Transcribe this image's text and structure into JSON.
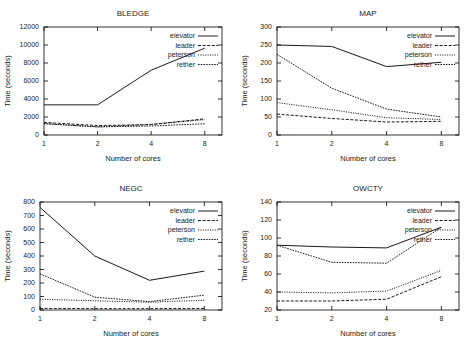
{
  "figure": {
    "width": 473,
    "height": 350,
    "background": "#ffffff",
    "line_color": "#000000",
    "text_color": "#222222",
    "series_names": [
      "elevator",
      "leader",
      "peterson",
      "rether"
    ],
    "series_styles": [
      "solid",
      "dashed",
      "dotted",
      "thin-dashdot"
    ],
    "common_xlabel": "Number of cores",
    "common_ylabel": "Time (seconds)"
  },
  "chart_data": [
    {
      "type": "line",
      "title": "BLEDGE",
      "xlabel": "Number of cores",
      "ylabel": "Time (seconds)",
      "x": [
        1,
        2,
        4,
        8
      ],
      "xticklabels": [
        "1",
        "2",
        "4",
        "8"
      ],
      "xscale": "log2",
      "xlim": [
        1,
        10
      ],
      "ylim": [
        0,
        12000
      ],
      "yticks": [
        0,
        2000,
        4000,
        6000,
        8000,
        10000,
        12000
      ],
      "yticklabels": [
        "0",
        "2000",
        "4000",
        "6000",
        "8000",
        "10000",
        "12000"
      ],
      "grid": false,
      "legend_position": "upper right",
      "series": [
        {
          "name": "elevator",
          "style": "solid",
          "values": [
            3350,
            3350,
            7200,
            9650
          ]
        },
        {
          "name": "leader",
          "style": "dashed",
          "values": [
            1400,
            1050,
            1150,
            1800
          ]
        },
        {
          "name": "peterson",
          "style": "dotted",
          "values": [
            1280,
            900,
            1200,
            1700
          ]
        },
        {
          "name": "rether",
          "style": "thin-dashdot",
          "values": [
            1250,
            900,
            1000,
            1250
          ]
        }
      ]
    },
    {
      "type": "line",
      "title": "MAP",
      "xlabel": "Number of cores",
      "ylabel": "Time (seconds)",
      "x": [
        1,
        2,
        4,
        8
      ],
      "xticklabels": [
        "1",
        "2",
        "4",
        "8"
      ],
      "xscale": "log2",
      "xlim": [
        1,
        10
      ],
      "ylim": [
        0,
        300
      ],
      "yticks": [
        0,
        50,
        100,
        150,
        200,
        250,
        300
      ],
      "yticklabels": [
        "0",
        "50",
        "100",
        "150",
        "200",
        "250",
        "300"
      ],
      "grid": false,
      "legend_position": "upper right",
      "series": [
        {
          "name": "elevator",
          "style": "solid",
          "values": [
            250,
            246,
            190,
            202
          ]
        },
        {
          "name": "leader",
          "style": "dashed",
          "values": [
            58,
            46,
            36,
            38
          ]
        },
        {
          "name": "peterson",
          "style": "dotted",
          "values": [
            90,
            70,
            48,
            43
          ]
        },
        {
          "name": "rether",
          "style": "thin-dashdot",
          "values": [
            224,
            130,
            72,
            50
          ]
        }
      ]
    },
    {
      "type": "line",
      "title": "NEGC",
      "xlabel": "Number of cores",
      "ylabel": "Time (seconds)",
      "x": [
        1,
        2,
        4,
        8
      ],
      "xticklabels": [
        "1",
        "2",
        "4",
        "8"
      ],
      "xscale": "log2",
      "xlim": [
        1,
        10
      ],
      "ylim": [
        0,
        800
      ],
      "yticks": [
        0,
        100,
        200,
        300,
        400,
        500,
        600,
        700,
        800
      ],
      "yticklabels": [
        "0",
        "100",
        "200",
        "300",
        "400",
        "500",
        "600",
        "700",
        "800"
      ],
      "grid": false,
      "legend_position": "upper right",
      "series": [
        {
          "name": "elevator",
          "style": "solid",
          "values": [
            760,
            400,
            220,
            288
          ]
        },
        {
          "name": "leader",
          "style": "dashed",
          "values": [
            12,
            10,
            10,
            12
          ]
        },
        {
          "name": "peterson",
          "style": "dotted",
          "values": [
            80,
            68,
            58,
            72
          ]
        },
        {
          "name": "rether",
          "style": "thin-dashdot",
          "values": [
            268,
            95,
            62,
            110
          ]
        }
      ]
    },
    {
      "type": "line",
      "title": "OWCTY",
      "xlabel": "Number of cores",
      "ylabel": "Time (seconds)",
      "x": [
        1,
        2,
        4,
        8
      ],
      "xticklabels": [
        "1",
        "2",
        "4",
        "8"
      ],
      "xscale": "log2",
      "xlim": [
        1,
        10
      ],
      "ylim": [
        20,
        140
      ],
      "yticks": [
        20,
        40,
        60,
        80,
        100,
        120,
        140
      ],
      "yticklabels": [
        "20",
        "40",
        "60",
        "80",
        "100",
        "120",
        "140"
      ],
      "grid": false,
      "legend_position": "upper right",
      "series": [
        {
          "name": "elevator",
          "style": "solid",
          "values": [
            92,
            90,
            89,
            112
          ]
        },
        {
          "name": "leader",
          "style": "dashed",
          "values": [
            30,
            30,
            32,
            57
          ]
        },
        {
          "name": "peterson",
          "style": "dotted",
          "values": [
            40,
            39,
            41,
            64
          ]
        },
        {
          "name": "rether",
          "style": "thin-dashdot",
          "values": [
            92,
            73,
            72,
            112
          ]
        }
      ]
    }
  ]
}
